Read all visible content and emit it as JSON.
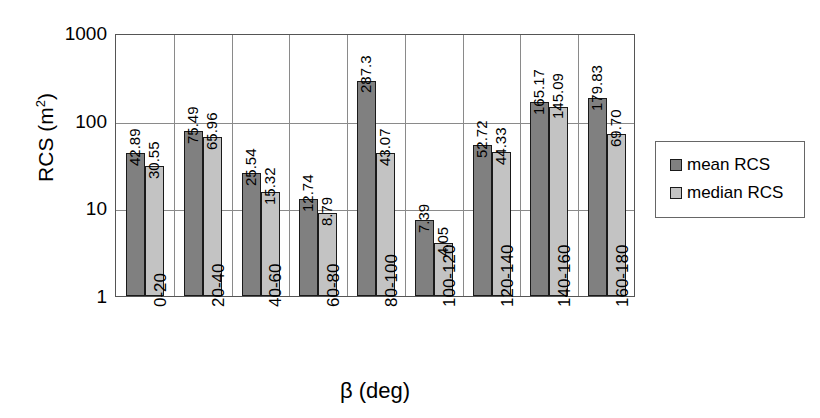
{
  "chart_data": {
    "type": "bar",
    "title": "",
    "xlabel": "β (deg)",
    "ylabel": "RCS (m²)",
    "ylabel_base": "RCS (m",
    "ylabel_sup": "2",
    "ylabel_close": ")",
    "yscale": "log",
    "ylim": [
      1,
      1000
    ],
    "ytick_labels": [
      "1000",
      "100",
      "10",
      "1"
    ],
    "ytick_values": [
      1000,
      100,
      10,
      1
    ],
    "grid": true,
    "legend_position": "right",
    "categories": [
      "0-20",
      "20-40",
      "40-60",
      "60-80",
      "80-100",
      "100-120",
      "120-140",
      "140-160",
      "160-180"
    ],
    "series": [
      {
        "name": "mean RCS",
        "color": "#808080",
        "values": [
          42.89,
          75.49,
          25.54,
          12.74,
          287.3,
          7.39,
          52.72,
          165.17,
          179.83
        ],
        "labels": [
          "42.89",
          "75.49",
          "25.54",
          "12.74",
          "287.3",
          "7.39",
          "52.72",
          "165.17",
          "179.83"
        ]
      },
      {
        "name": "median RCS",
        "color": "#c3c3c3",
        "values": [
          30.55,
          65.96,
          15.32,
          8.79,
          43.07,
          4.05,
          44.33,
          145.09,
          69.7
        ],
        "labels": [
          "30.55",
          "65.96",
          "15.32",
          "8.79",
          "43.07",
          "4.05",
          "44.33",
          "145.09",
          "69.70"
        ]
      }
    ]
  },
  "legend": {
    "items": [
      {
        "label": "mean RCS",
        "key": "mean"
      },
      {
        "label": "median RCS",
        "key": "median"
      }
    ]
  }
}
